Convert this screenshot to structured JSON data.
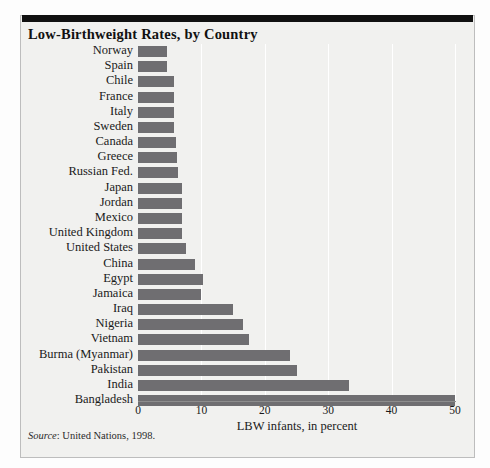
{
  "panel": {
    "title": "Low-Birthweight Rates, by Country",
    "source_label": "Source",
    "source_text": ": United Nations, 1998."
  },
  "chart_data": {
    "type": "bar",
    "orientation": "horizontal",
    "title": "Low-Birthweight Rates, by Country",
    "xlabel": "LBW infants, in percent",
    "ylabel": "",
    "xlim": [
      0,
      50
    ],
    "xticks": [
      0,
      10,
      20,
      30,
      40,
      50
    ],
    "xticklabels": [
      "0",
      "10",
      "20",
      "30",
      "40",
      "50"
    ],
    "grid": "vertical",
    "legend": "none",
    "bar_color": "#6f6e71",
    "background_color": "#f1f1ef",
    "categories": [
      "Norway",
      "Spain",
      "Chile",
      "France",
      "Italy",
      "Sweden",
      "Canada",
      "Greece",
      "Russian Fed.",
      "Japan",
      "Jordan",
      "Mexico",
      "United Kingdom",
      "United States",
      "China",
      "Egypt",
      "Jamaica",
      "Iraq",
      "Nigeria",
      "Vietnam",
      "Burma (Myanmar)",
      "Pakistan",
      "India",
      "Bangladesh"
    ],
    "values": [
      4.5,
      4.5,
      5.7,
      5.7,
      5.7,
      5.7,
      6.0,
      6.2,
      6.3,
      7.0,
      7.0,
      7.0,
      7.0,
      7.5,
      9.0,
      10.2,
      10.0,
      15.0,
      16.5,
      17.5,
      24.0,
      25.0,
      33.3,
      50.0
    ]
  }
}
